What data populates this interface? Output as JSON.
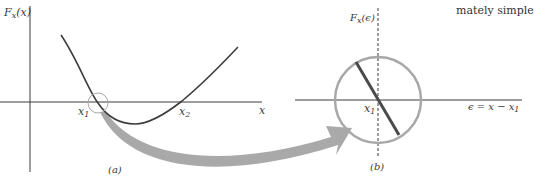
{
  "corner_text": "mately simple",
  "panel_a": {
    "ylabel_main": "F",
    "ylabel_sub": "x",
    "ylabel_arg": "(x)",
    "xlabel": "x",
    "root1_main": "x",
    "root1_sub": "1",
    "root2_main": "x",
    "root2_sub": "2",
    "caption": "(a)"
  },
  "panel_b": {
    "ylabel_main": "F",
    "ylabel_sub": "x",
    "ylabel_arg": "(ϵ)",
    "xlabel_main": "ϵ = x − x",
    "xlabel_sub": "1",
    "origin_main": "x",
    "origin_sub": "1",
    "caption": "(b)"
  },
  "colors": {
    "axis": "#3a3a3a",
    "curve": "#3d3d3d",
    "circle": "#a8a8a8",
    "arrow": "#a9a9a9"
  }
}
